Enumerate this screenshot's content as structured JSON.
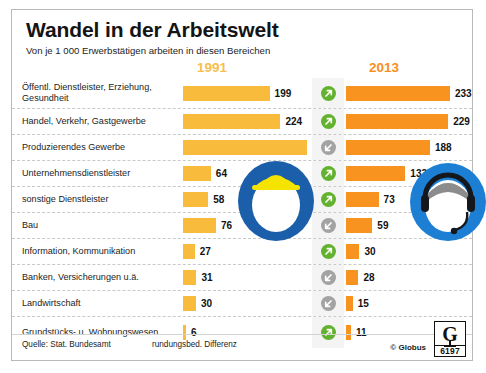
{
  "header": {
    "title": "Wandel in der Arbeitswelt",
    "subtitle": "Von je 1 000 Erwerbstätigen arbeiten in diesen Bereichen",
    "year_left": "1991",
    "year_right": "2013"
  },
  "footer": {
    "source": "Quelle: Stat. Bundesamt",
    "note": "rundungsbed. Differenz",
    "copyright": "© Globus",
    "logo_letter": "G",
    "logo_number": "6197"
  },
  "colors": {
    "bar_1991": "#F9BB3C",
    "bar_2013": "#F7931E",
    "year_1991": "#F9BE4D",
    "year_2013": "#F5901E",
    "arrow_up": "#63B22F",
    "arrow_down": "#A3A3A3",
    "icon_blue_hat": "#1B5FAA",
    "icon_blue_headset": "#1C7FD4",
    "icon_yellow": "#F5E400"
  },
  "chart_data": {
    "type": "bar",
    "title": "Wandel in der Arbeitswelt",
    "subtitle": "Von je 1 000 Erwerbstätigen arbeiten in diesen Bereichen",
    "xlabel": "",
    "ylabel": "",
    "grid": false,
    "legend_position": "top",
    "xlim": [
      0,
      285
    ],
    "categories": [
      "Öffentl. Dienstleister, Erziehung, Gesundheit",
      "Handel, Verkehr, Gastgewerbe",
      "Produzierendes Gewerbe",
      "Unternehmensdienstleister",
      "sonstige Dienstleister",
      "Bau",
      "Information, Kommunikation",
      "Banken, Versicherungen u.ä.",
      "Landwirtschaft",
      "Grundstücks- u. Wohnungswesen"
    ],
    "series": [
      {
        "name": "1991",
        "values": [
          199,
          224,
          285,
          64,
          58,
          76,
          27,
          31,
          30,
          6
        ]
      },
      {
        "name": "2013",
        "values": [
          233,
          229,
          188,
          133,
          73,
          59,
          30,
          28,
          15,
          11
        ]
      }
    ],
    "trends": [
      "up",
      "up",
      "down",
      "up",
      "up",
      "down",
      "up",
      "down",
      "down",
      "up"
    ]
  },
  "rows": [
    {
      "label": "Öffentl. Dienstleister, Erziehung, Gesundheit",
      "v1991": "199",
      "v2013": "233",
      "trend": "up"
    },
    {
      "label": "Handel, Verkehr, Gastgewerbe",
      "v1991": "224",
      "v2013": "229",
      "trend": "up"
    },
    {
      "label": "Produzierendes Gewerbe",
      "v1991": "285",
      "v2013": "188",
      "trend": "down"
    },
    {
      "label": "Unternehmensdienstleister",
      "v1991": "64",
      "v2013": "133",
      "trend": "up"
    },
    {
      "label": "sonstige Dienstleister",
      "v1991": "58",
      "v2013": "73",
      "trend": "up"
    },
    {
      "label": "Bau",
      "v1991": "76",
      "v2013": "59",
      "trend": "down"
    },
    {
      "label": "Information, Kommunikation",
      "v1991": "27",
      "v2013": "30",
      "trend": "up"
    },
    {
      "label": "Banken, Versicherungen u.ä.",
      "v1991": "31",
      "v2013": "28",
      "trend": "down"
    },
    {
      "label": "Landwirtschaft",
      "v1991": "30",
      "v2013": "15",
      "trend": "down"
    },
    {
      "label": "Grundstücks- u. Wohnungswesen",
      "v1991": "6",
      "v2013": "11",
      "trend": "up"
    }
  ]
}
